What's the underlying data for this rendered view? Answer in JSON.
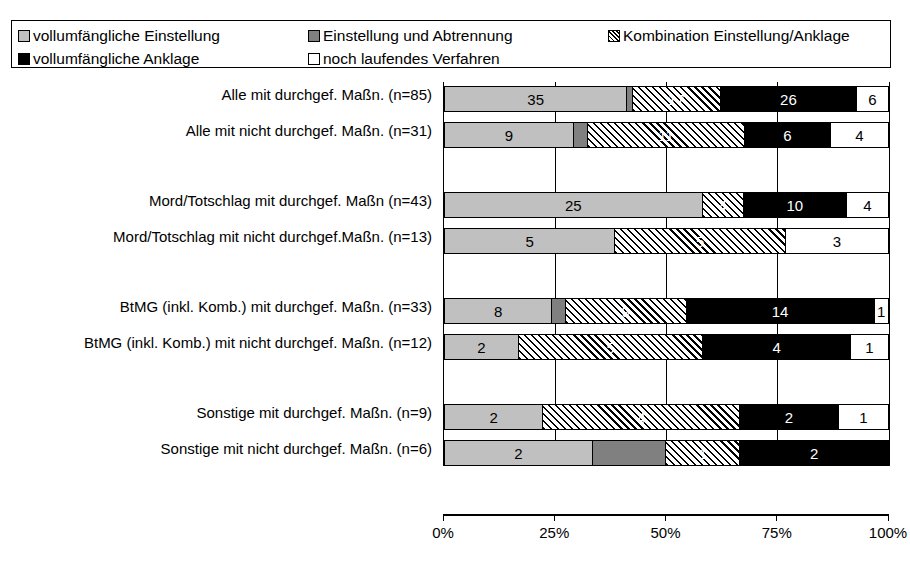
{
  "legend": {
    "items": [
      {
        "label": "vollumfängliche Einstellung",
        "pattern": "light-gray",
        "color": "#c0c0c0"
      },
      {
        "label": "Einstellung und Abtrennung",
        "pattern": "dark-gray",
        "color": "#808080"
      },
      {
        "label": "Kombination Einstellung/Anklage",
        "pattern": "diagonal-hatch",
        "color": "#000000"
      },
      {
        "label": "vollumfängliche Anklage",
        "pattern": "black",
        "color": "#000000"
      },
      {
        "label": "noch laufendes Verfahren",
        "pattern": "white",
        "color": "#ffffff"
      }
    ]
  },
  "chart_data": {
    "type": "bar",
    "orientation": "horizontal",
    "stacked": true,
    "stack_mode": "percent",
    "title": "",
    "xlabel": "",
    "ylabel": "",
    "xlim": [
      0,
      100
    ],
    "xticks": [
      "0%",
      "25%",
      "50%",
      "75%",
      "100%"
    ],
    "grid": true,
    "legend_position": "top",
    "categories": [
      "Alle mit durchgef. Maßn. (n=85)",
      "Alle mit nicht durchgef. Maßn. (n=31)",
      "Mord/Totschlag mit durchgef. Maßn (n=43)",
      "Mord/Totschlag mit nicht durchgef.Maßn. (n=13)",
      "BtMG (inkl. Komb.) mit durchgef. Maßn. (n=33)",
      "BtMG (inkl. Komb.) mit nicht durchgef. Maßn. (n=12)",
      "Sonstige mit durchgef. Maßn. (n=9)",
      "Sonstige mit nicht durchgef. Maßn. (n=6)"
    ],
    "totals": [
      85,
      31,
      43,
      13,
      33,
      12,
      9,
      6
    ],
    "series": [
      {
        "name": "vollumfängliche Einstellung",
        "values": [
          35,
          9,
          25,
          5,
          8,
          2,
          2,
          2
        ]
      },
      {
        "name": "Einstellung und Abtrennung",
        "values": [
          1,
          1,
          0,
          0,
          1,
          0,
          0,
          1
        ]
      },
      {
        "name": "Kombination Einstellung/Anklage",
        "values": [
          17,
          11,
          4,
          5,
          9,
          5,
          4,
          1
        ]
      },
      {
        "name": "vollumfängliche Anklage",
        "values": [
          26,
          6,
          10,
          0,
          14,
          4,
          2,
          2
        ]
      },
      {
        "name": "noch laufendes Verfahren",
        "values": [
          6,
          4,
          4,
          3,
          1,
          1,
          1,
          0
        ]
      }
    ],
    "bars": [
      {
        "category_index": 0,
        "segments": [
          {
            "series": 0,
            "value": 35,
            "label": "35"
          },
          {
            "series": 1,
            "value": 1,
            "label": ""
          },
          {
            "series": 2,
            "value": 17,
            "label": "17"
          },
          {
            "series": 3,
            "value": 26,
            "label": "26"
          },
          {
            "series": 4,
            "value": 6,
            "label": "6"
          }
        ]
      },
      {
        "category_index": 1,
        "segments": [
          {
            "series": 0,
            "value": 9,
            "label": "9"
          },
          {
            "series": 1,
            "value": 1,
            "label": ""
          },
          {
            "series": 2,
            "value": 11,
            "label": "11"
          },
          {
            "series": 3,
            "value": 6,
            "label": "6"
          },
          {
            "series": 4,
            "value": 4,
            "label": "4"
          }
        ]
      },
      {
        "category_index": 2,
        "segments": [
          {
            "series": 0,
            "value": 25,
            "label": "25"
          },
          {
            "series": 2,
            "value": 4,
            "label": "4"
          },
          {
            "series": 3,
            "value": 10,
            "label": "10"
          },
          {
            "series": 4,
            "value": 4,
            "label": "4"
          }
        ]
      },
      {
        "category_index": 3,
        "segments": [
          {
            "series": 0,
            "value": 5,
            "label": "5"
          },
          {
            "series": 2,
            "value": 5,
            "label": "5"
          },
          {
            "series": 4,
            "value": 3,
            "label": "3"
          }
        ]
      },
      {
        "category_index": 4,
        "segments": [
          {
            "series": 0,
            "value": 8,
            "label": "8"
          },
          {
            "series": 1,
            "value": 1,
            "label": ""
          },
          {
            "series": 2,
            "value": 9,
            "label": "9"
          },
          {
            "series": 3,
            "value": 14,
            "label": "14"
          },
          {
            "series": 4,
            "value": 1,
            "label": "1"
          }
        ]
      },
      {
        "category_index": 5,
        "segments": [
          {
            "series": 0,
            "value": 2,
            "label": "2"
          },
          {
            "series": 2,
            "value": 5,
            "label": "5"
          },
          {
            "series": 3,
            "value": 4,
            "label": "4"
          },
          {
            "series": 4,
            "value": 1,
            "label": "1"
          }
        ]
      },
      {
        "category_index": 6,
        "segments": [
          {
            "series": 0,
            "value": 2,
            "label": "2"
          },
          {
            "series": 2,
            "value": 4,
            "label": "4"
          },
          {
            "series": 3,
            "value": 2,
            "label": "2"
          },
          {
            "series": 4,
            "value": 1,
            "label": "1"
          }
        ]
      },
      {
        "category_index": 7,
        "segments": [
          {
            "series": 0,
            "value": 2,
            "label": "2"
          },
          {
            "series": 1,
            "value": 1,
            "label": ""
          },
          {
            "series": 2,
            "value": 1,
            "label": "1"
          },
          {
            "series": 3,
            "value": 2,
            "label": "2"
          }
        ]
      }
    ]
  }
}
